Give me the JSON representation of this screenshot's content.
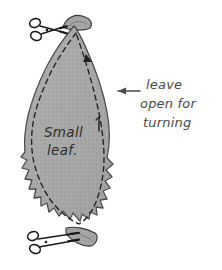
{
  "canvas": {
    "width": 222,
    "height": 270,
    "background_color": "#ffffff",
    "title": "Small leaf sewing pattern diagram"
  },
  "colors": {
    "background": "#ffffff",
    "fabric_fill": "#a9a9a9",
    "fabric_fill_light": "#b6b6b6",
    "fabric_fill_dark": "#9a9a9a",
    "outline_ink": "#3a3a3a",
    "stitch_ink": "#222222",
    "annotation_ink": "#4a4a4a",
    "label_ink": "#2e2e2e",
    "scissors_ink": "#1a1a1a"
  },
  "shapes": {
    "leaf": {
      "name": "small-leaf-fabric-piece",
      "description": "gray teardrop shaped fabric piece with scalloped clipped seam edges",
      "fill": "#a9a9a9",
      "stroke": "#3a3a3a"
    },
    "stitch_line": {
      "name": "dashed-stitch-line",
      "description": "dashed sewing line inset from the fabric edge",
      "style": "dashed",
      "dash_pattern": "5 4",
      "stroke": "#222222"
    },
    "top_tab": {
      "name": "top-fabric-tab",
      "description": "small folded fabric tab at the top tip being cut"
    },
    "bottom_tab": {
      "name": "bottom-fabric-tab",
      "description": "small pointed fabric tab at the bottom tip being cut"
    }
  },
  "labels": {
    "leaf_label_line1": "Small",
    "leaf_label_line2": "leaf."
  },
  "annotation": {
    "line1": "leave",
    "line2": "open for",
    "line3": "turning",
    "arrow_name": "leave-open-arrow",
    "arrow_direction": "left"
  },
  "icons": {
    "scissors_top": {
      "name": "scissors-icon-top",
      "glyph": "scissors",
      "orientation": "blades-pointing-right"
    },
    "scissors_bottom": {
      "name": "scissors-icon-bottom",
      "glyph": "scissors",
      "orientation": "blades-pointing-right"
    },
    "stitch_direction_arrow_top": {
      "name": "stitch-direction-arrowhead-top",
      "glyph": "arrowhead"
    },
    "stitch_tick_right": {
      "name": "stitch-tick-mark-right",
      "glyph": "tick"
    }
  }
}
